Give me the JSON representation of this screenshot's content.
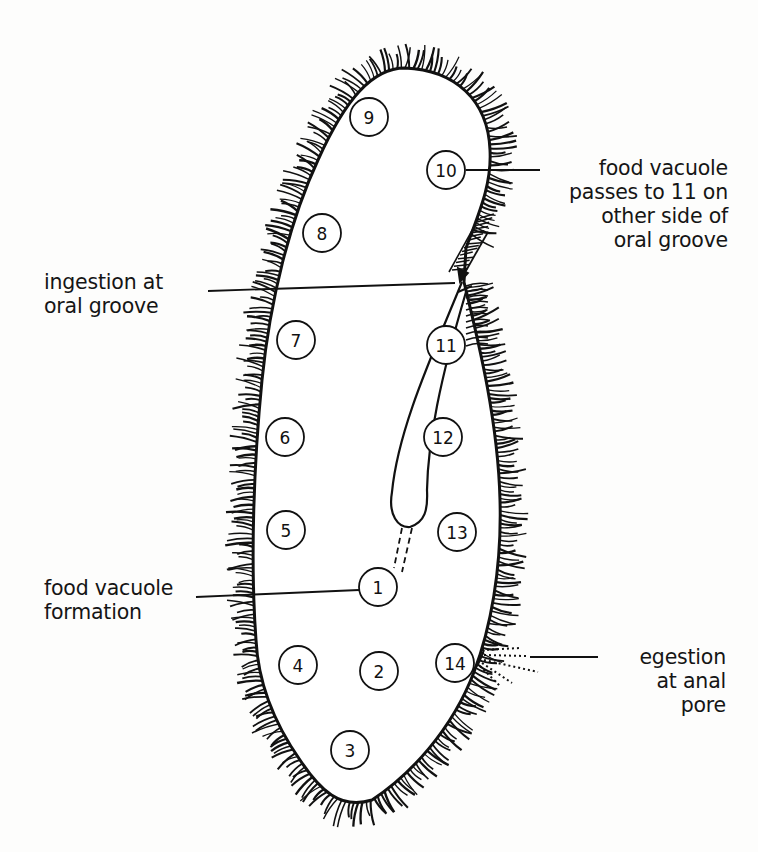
{
  "figure": {
    "vacuole_positions": [
      {
        "n": "1",
        "x": 378,
        "y": 587
      },
      {
        "n": "2",
        "x": 379,
        "y": 671
      },
      {
        "n": "3",
        "x": 350,
        "y": 750
      },
      {
        "n": "4",
        "x": 298,
        "y": 665
      },
      {
        "n": "5",
        "x": 286,
        "y": 530
      },
      {
        "n": "6",
        "x": 285,
        "y": 437
      },
      {
        "n": "7",
        "x": 296,
        "y": 340
      },
      {
        "n": "8",
        "x": 322,
        "y": 233
      },
      {
        "n": "9",
        "x": 369,
        "y": 117
      },
      {
        "n": "10",
        "x": 446,
        "y": 170
      },
      {
        "n": "11",
        "x": 446,
        "y": 345
      },
      {
        "n": "12",
        "x": 443,
        "y": 437
      },
      {
        "n": "13",
        "x": 457,
        "y": 532
      },
      {
        "n": "14",
        "x": 455,
        "y": 663
      }
    ]
  },
  "labels": {
    "passes": {
      "lines": [
        "food vacuole",
        "passes to 11 on",
        "other side of",
        "oral groove"
      ]
    },
    "ingestion": {
      "lines": [
        "ingestion at",
        "oral groove"
      ]
    },
    "formation": {
      "lines": [
        "food vacuole",
        "formation"
      ]
    },
    "egestion": {
      "lines": [
        "egestion",
        "at anal",
        "pore"
      ]
    }
  },
  "colors": {
    "ink": "#111111",
    "background": "#fdfdfc",
    "cell_fill": "#ffffff"
  }
}
